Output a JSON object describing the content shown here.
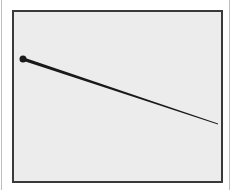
{
  "figure": {
    "background_color": "#ececec",
    "frame_color": "#3a3a3a",
    "pin_color": "#1a1a1a",
    "pin": {
      "head": {
        "x": 23,
        "y": 59,
        "r": 3.5
      },
      "tip": {
        "x": 218,
        "y": 124
      }
    }
  }
}
